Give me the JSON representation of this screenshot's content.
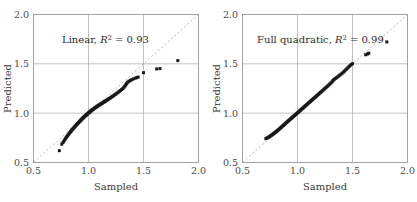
{
  "chart_data": [
    {
      "type": "scatter",
      "title": "",
      "annotation": "Linear, R² = 0.93",
      "annotation_model": "Linear",
      "annotation_stat_symbol": "R",
      "annotation_stat_exponent": "2",
      "annotation_stat_value": "0.93",
      "xlabel": "Sampled",
      "ylabel": "Predicted",
      "xlim": [
        0.5,
        2.0
      ],
      "ylim": [
        0.5,
        2.0
      ],
      "xticks": [
        0.5,
        1.0,
        1.5,
        2.0
      ],
      "yticks": [
        0.5,
        1.0,
        1.5,
        2.0
      ],
      "xticklabels": [
        "0.5",
        "1.0",
        "1.5",
        "2.0"
      ],
      "yticklabels": [
        "0.5",
        "1.0",
        "1.5",
        "2.0"
      ],
      "grid": true,
      "legend": "none",
      "reference_line": {
        "style": "dashed",
        "from": [
          0.5,
          0.5
        ],
        "to": [
          2.0,
          2.0
        ],
        "label": "identity"
      },
      "marker": {
        "shape": "square",
        "color": "#1a1a1a",
        "size": 3.0
      },
      "points": [
        [
          0.735,
          0.62
        ],
        [
          0.757,
          0.686
        ],
        [
          0.768,
          0.702
        ],
        [
          0.776,
          0.716
        ],
        [
          0.783,
          0.729
        ],
        [
          0.79,
          0.741
        ],
        [
          0.797,
          0.752
        ],
        [
          0.803,
          0.762
        ],
        [
          0.809,
          0.771
        ],
        [
          0.815,
          0.78
        ],
        [
          0.821,
          0.789
        ],
        [
          0.827,
          0.797
        ],
        [
          0.832,
          0.805
        ],
        [
          0.838,
          0.813
        ],
        [
          0.843,
          0.82
        ],
        [
          0.848,
          0.827
        ],
        [
          0.853,
          0.834
        ],
        [
          0.858,
          0.841
        ],
        [
          0.863,
          0.847
        ],
        [
          0.868,
          0.853
        ],
        [
          0.873,
          0.86
        ],
        [
          0.878,
          0.866
        ],
        [
          0.882,
          0.872
        ],
        [
          0.887,
          0.877
        ],
        [
          0.891,
          0.883
        ],
        [
          0.896,
          0.888
        ],
        [
          0.9,
          0.894
        ],
        [
          0.905,
          0.899
        ],
        [
          0.909,
          0.904
        ],
        [
          0.913,
          0.909
        ],
        [
          0.918,
          0.914
        ],
        [
          0.922,
          0.919
        ],
        [
          0.926,
          0.924
        ],
        [
          0.93,
          0.929
        ],
        [
          0.934,
          0.933
        ],
        [
          0.938,
          0.938
        ],
        [
          0.942,
          0.942
        ],
        [
          0.946,
          0.947
        ],
        [
          0.95,
          0.951
        ],
        [
          0.954,
          0.956
        ],
        [
          0.958,
          0.96
        ],
        [
          0.962,
          0.964
        ],
        [
          0.966,
          0.968
        ],
        [
          0.97,
          0.972
        ],
        [
          0.974,
          0.976
        ],
        [
          0.978,
          0.98
        ],
        [
          0.982,
          0.984
        ],
        [
          0.986,
          0.988
        ],
        [
          0.99,
          0.992
        ],
        [
          0.994,
          0.996
        ],
        [
          0.998,
          1.0
        ],
        [
          1.002,
          1.004
        ],
        [
          1.006,
          1.008
        ],
        [
          1.01,
          1.011
        ],
        [
          1.014,
          1.015
        ],
        [
          1.018,
          1.019
        ],
        [
          1.022,
          1.023
        ],
        [
          1.026,
          1.026
        ],
        [
          1.03,
          1.03
        ],
        [
          1.035,
          1.034
        ],
        [
          1.039,
          1.037
        ],
        [
          1.043,
          1.041
        ],
        [
          1.047,
          1.044
        ],
        [
          1.052,
          1.048
        ],
        [
          1.056,
          1.051
        ],
        [
          1.06,
          1.055
        ],
        [
          1.065,
          1.058
        ],
        [
          1.069,
          1.062
        ],
        [
          1.074,
          1.065
        ],
        [
          1.078,
          1.069
        ],
        [
          1.083,
          1.072
        ],
        [
          1.088,
          1.076
        ],
        [
          1.092,
          1.079
        ],
        [
          1.097,
          1.083
        ],
        [
          1.102,
          1.086
        ],
        [
          1.107,
          1.09
        ],
        [
          1.112,
          1.093
        ],
        [
          1.117,
          1.097
        ],
        [
          1.122,
          1.1
        ],
        [
          1.128,
          1.104
        ],
        [
          1.133,
          1.108
        ],
        [
          1.139,
          1.112
        ],
        [
          1.144,
          1.116
        ],
        [
          1.15,
          1.12
        ],
        [
          1.156,
          1.124
        ],
        [
          1.162,
          1.128
        ],
        [
          1.168,
          1.133
        ],
        [
          1.174,
          1.137
        ],
        [
          1.181,
          1.142
        ],
        [
          1.188,
          1.147
        ],
        [
          1.195,
          1.152
        ],
        [
          1.202,
          1.158
        ],
        [
          1.209,
          1.163
        ],
        [
          1.217,
          1.169
        ],
        [
          1.225,
          1.175
        ],
        [
          1.233,
          1.182
        ],
        [
          1.242,
          1.189
        ],
        [
          1.251,
          1.196
        ],
        [
          1.26,
          1.204
        ],
        [
          1.27,
          1.212
        ],
        [
          1.28,
          1.221
        ],
        [
          1.291,
          1.23
        ],
        [
          1.302,
          1.24
        ],
        [
          1.313,
          1.25
        ],
        [
          1.322,
          1.262
        ],
        [
          1.33,
          1.274
        ],
        [
          1.338,
          1.286
        ],
        [
          1.345,
          1.298
        ],
        [
          1.352,
          1.308
        ],
        [
          1.36,
          1.317
        ],
        [
          1.37,
          1.325
        ],
        [
          1.382,
          1.332
        ],
        [
          1.395,
          1.34
        ],
        [
          1.41,
          1.348
        ],
        [
          1.425,
          1.355
        ],
        [
          1.44,
          1.36
        ],
        [
          1.452,
          1.366
        ],
        [
          1.5,
          1.41
        ],
        [
          1.62,
          1.448
        ],
        [
          1.65,
          1.452
        ],
        [
          1.812,
          1.533
        ]
      ]
    },
    {
      "type": "scatter",
      "title": "",
      "annotation": "Full quadratic, R² = 0.99",
      "annotation_model": "Full quadratic",
      "annotation_stat_symbol": "R",
      "annotation_stat_exponent": "2",
      "annotation_stat_value": "0.99",
      "xlabel": "Sampled",
      "ylabel": "Predicted",
      "xlim": [
        0.5,
        2.0
      ],
      "ylim": [
        0.5,
        2.0
      ],
      "xticks": [
        0.5,
        1.0,
        1.5,
        2.0
      ],
      "yticks": [
        0.5,
        1.0,
        1.5,
        2.0
      ],
      "xticklabels": [
        "0.5",
        "1.0",
        "1.5",
        "2.0"
      ],
      "yticklabels": [
        "0.5",
        "1.0",
        "1.5",
        "2.0"
      ],
      "grid": true,
      "legend": "none",
      "reference_line": {
        "style": "dashed",
        "from": [
          0.5,
          0.5
        ],
        "to": [
          2.0,
          2.0
        ],
        "label": "identity"
      },
      "marker": {
        "shape": "square",
        "color": "#1a1a1a",
        "size": 3.0
      },
      "points": [
        [
          0.712,
          0.742
        ],
        [
          0.722,
          0.748
        ],
        [
          0.73,
          0.752
        ],
        [
          0.737,
          0.757
        ],
        [
          0.744,
          0.762
        ],
        [
          0.75,
          0.766
        ],
        [
          0.757,
          0.771
        ],
        [
          0.763,
          0.776
        ],
        [
          0.769,
          0.781
        ],
        [
          0.775,
          0.786
        ],
        [
          0.781,
          0.791
        ],
        [
          0.787,
          0.796
        ],
        [
          0.793,
          0.801
        ],
        [
          0.799,
          0.806
        ],
        [
          0.805,
          0.811
        ],
        [
          0.811,
          0.817
        ],
        [
          0.817,
          0.822
        ],
        [
          0.823,
          0.828
        ],
        [
          0.829,
          0.834
        ],
        [
          0.835,
          0.84
        ],
        [
          0.841,
          0.846
        ],
        [
          0.847,
          0.852
        ],
        [
          0.853,
          0.858
        ],
        [
          0.859,
          0.864
        ],
        [
          0.865,
          0.87
        ],
        [
          0.871,
          0.876
        ],
        [
          0.877,
          0.882
        ],
        [
          0.883,
          0.888
        ],
        [
          0.889,
          0.894
        ],
        [
          0.895,
          0.9
        ],
        [
          0.901,
          0.906
        ],
        [
          0.907,
          0.912
        ],
        [
          0.913,
          0.918
        ],
        [
          0.919,
          0.924
        ],
        [
          0.925,
          0.93
        ],
        [
          0.931,
          0.936
        ],
        [
          0.937,
          0.942
        ],
        [
          0.943,
          0.948
        ],
        [
          0.949,
          0.953
        ],
        [
          0.955,
          0.959
        ],
        [
          0.961,
          0.965
        ],
        [
          0.967,
          0.971
        ],
        [
          0.973,
          0.977
        ],
        [
          0.979,
          0.983
        ],
        [
          0.985,
          0.988
        ],
        [
          0.991,
          0.994
        ],
        [
          0.997,
          1.0
        ],
        [
          1.003,
          1.006
        ],
        [
          1.009,
          1.012
        ],
        [
          1.015,
          1.018
        ],
        [
          1.021,
          1.024
        ],
        [
          1.027,
          1.03
        ],
        [
          1.033,
          1.036
        ],
        [
          1.039,
          1.042
        ],
        [
          1.045,
          1.048
        ],
        [
          1.051,
          1.054
        ],
        [
          1.057,
          1.06
        ],
        [
          1.063,
          1.066
        ],
        [
          1.069,
          1.072
        ],
        [
          1.075,
          1.078
        ],
        [
          1.081,
          1.084
        ],
        [
          1.087,
          1.09
        ],
        [
          1.093,
          1.096
        ],
        [
          1.1,
          1.102
        ],
        [
          1.106,
          1.108
        ],
        [
          1.112,
          1.114
        ],
        [
          1.119,
          1.121
        ],
        [
          1.125,
          1.127
        ],
        [
          1.132,
          1.134
        ],
        [
          1.138,
          1.14
        ],
        [
          1.145,
          1.147
        ],
        [
          1.152,
          1.153
        ],
        [
          1.159,
          1.16
        ],
        [
          1.166,
          1.167
        ],
        [
          1.173,
          1.174
        ],
        [
          1.18,
          1.181
        ],
        [
          1.187,
          1.188
        ],
        [
          1.194,
          1.195
        ],
        [
          1.202,
          1.203
        ],
        [
          1.209,
          1.21
        ],
        [
          1.217,
          1.218
        ],
        [
          1.225,
          1.226
        ],
        [
          1.233,
          1.234
        ],
        [
          1.241,
          1.242
        ],
        [
          1.25,
          1.251
        ],
        [
          1.258,
          1.259
        ],
        [
          1.267,
          1.268
        ],
        [
          1.276,
          1.277
        ],
        [
          1.285,
          1.286
        ],
        [
          1.294,
          1.296
        ],
        [
          1.304,
          1.306
        ],
        [
          1.313,
          1.316
        ],
        [
          1.32,
          1.327
        ],
        [
          1.328,
          1.337
        ],
        [
          1.336,
          1.345
        ],
        [
          1.345,
          1.352
        ],
        [
          1.355,
          1.36
        ],
        [
          1.365,
          1.368
        ],
        [
          1.375,
          1.377
        ],
        [
          1.385,
          1.386
        ],
        [
          1.396,
          1.396
        ],
        [
          1.407,
          1.406
        ],
        [
          1.418,
          1.416
        ],
        [
          1.428,
          1.427
        ],
        [
          1.438,
          1.438
        ],
        [
          1.448,
          1.449
        ],
        [
          1.458,
          1.46
        ],
        [
          1.468,
          1.471
        ],
        [
          1.478,
          1.482
        ],
        [
          1.489,
          1.493
        ],
        [
          1.5,
          1.502
        ],
        [
          1.62,
          1.592
        ],
        [
          1.636,
          1.6
        ],
        [
          1.648,
          1.608
        ],
        [
          1.812,
          1.722
        ]
      ]
    }
  ],
  "colors": {
    "marker": "#1a1a1a",
    "grid": "#a8a8a8",
    "axis": "#8c8c8c",
    "reference_line": "#9a9a9a",
    "text": "#3a3a3a",
    "background": "#ffffff"
  }
}
